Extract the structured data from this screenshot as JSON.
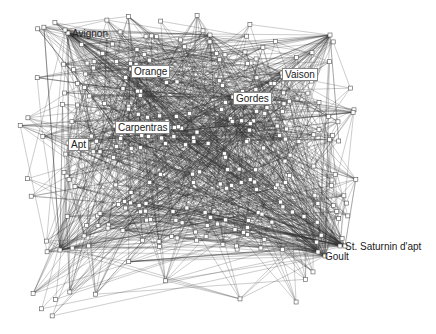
{
  "diagram": {
    "type": "network-graph",
    "labeled_nodes": [
      {
        "id": "avignon",
        "label": "Avignon",
        "x": 68,
        "y": 33,
        "boxed": false
      },
      {
        "id": "orange",
        "label": "Orange",
        "x": 131,
        "y": 69,
        "boxed": true
      },
      {
        "id": "vaison",
        "label": "Vaison",
        "x": 282,
        "y": 73,
        "boxed": true
      },
      {
        "id": "gordes",
        "label": "Gordes",
        "x": 233,
        "y": 97,
        "boxed": true
      },
      {
        "id": "carpentras",
        "label": "Carpentras",
        "x": 115,
        "y": 126,
        "boxed": true
      },
      {
        "id": "apt",
        "label": "Apt",
        "x": 68,
        "y": 143,
        "boxed": true
      },
      {
        "id": "st-saturnin",
        "label": "St. Saturnin d'apt",
        "x": 345,
        "y": 246,
        "boxed": false
      },
      {
        "id": "goult",
        "label": "Goult",
        "x": 325,
        "y": 256,
        "boxed": false
      }
    ],
    "node_color": "#ffffff",
    "node_stroke": "#555555",
    "edge_color": "#333333"
  }
}
